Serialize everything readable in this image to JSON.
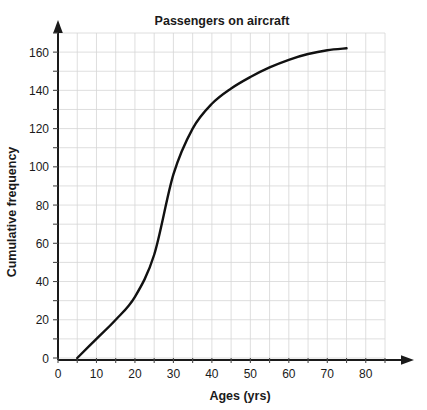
{
  "chart_data": {
    "type": "line",
    "title": "Passengers on aircraft",
    "xlabel": "Ages (yrs)",
    "ylabel": "Cumulative frequency",
    "xlim": [
      0,
      85
    ],
    "ylim": [
      0,
      170
    ],
    "grid": true,
    "legend": "none",
    "x_major_step": 10,
    "x_minor_step": 5,
    "y_major_step": 20,
    "y_minor_step": 10,
    "x_tick_labels": [
      "0",
      "10",
      "20",
      "30",
      "40",
      "50",
      "60",
      "70",
      "80"
    ],
    "x_tick_values": [
      0,
      10,
      20,
      30,
      40,
      50,
      60,
      70,
      80
    ],
    "y_tick_labels": [
      "0",
      "20",
      "40",
      "60",
      "80",
      "100",
      "120",
      "140",
      "160"
    ],
    "y_tick_values": [
      0,
      20,
      40,
      60,
      80,
      100,
      120,
      140,
      160
    ],
    "series": [
      {
        "name": "Cumulative frequency of passenger ages",
        "x": [
          5,
          10,
          15,
          20,
          25,
          30,
          35,
          40,
          45,
          50,
          55,
          60,
          65,
          70,
          75
        ],
        "values": [
          0,
          10,
          20,
          32,
          54,
          96,
          120,
          133,
          141,
          147,
          152,
          156,
          159,
          161,
          162
        ]
      }
    ],
    "curve_color": "#111111",
    "grid_color": "#d5d5d5",
    "axis_color": "#1a1a1a"
  },
  "axes": {
    "x_arrow": "arrow-right",
    "y_arrow": "arrow-up"
  }
}
